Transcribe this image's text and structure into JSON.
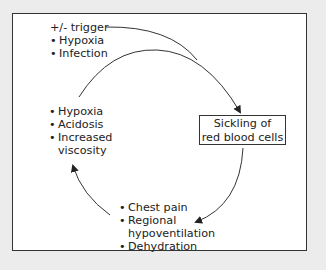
{
  "diagram": {
    "type": "cycle",
    "trigger": {
      "heading": "+/- trigger",
      "items": [
        "Hypoxia",
        "Infection"
      ]
    },
    "center_box": {
      "line1": "Sickling of",
      "line2": "red blood cells"
    },
    "bottom_node": {
      "items": [
        "Chest pain",
        "Regional",
        "hypoventilation",
        "Dehydration"
      ]
    },
    "left_node": {
      "items": [
        "Hypoxia",
        "Acidosis",
        "Increased",
        "viscosity"
      ]
    },
    "colors": {
      "line": "#333333",
      "background": "#ececec",
      "panel": "#ffffff"
    }
  }
}
